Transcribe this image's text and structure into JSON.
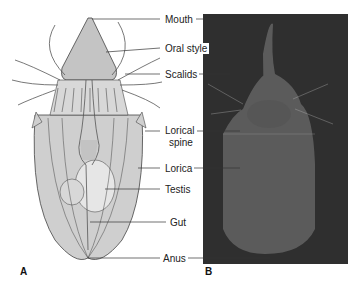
{
  "figure": {
    "panels": [
      "A",
      "B"
    ],
    "labels": [
      {
        "text": "Mouth",
        "x": 163,
        "y": 14
      },
      {
        "text": "Oral style",
        "x": 163,
        "y": 43
      },
      {
        "text": "Scalids",
        "x": 163,
        "y": 69
      },
      {
        "text": "Lorical",
        "x": 163,
        "y": 125
      },
      {
        "text": "spine",
        "x": 168,
        "y": 137
      },
      {
        "text": "Lorica",
        "x": 163,
        "y": 163
      },
      {
        "text": "Testis",
        "x": 163,
        "y": 184
      },
      {
        "text": "Gut",
        "x": 170,
        "y": 217
      },
      {
        "text": "Anus",
        "x": 163,
        "y": 253
      }
    ],
    "colors": {
      "illustration_fill": "#c9c9c9",
      "photo_bg": "#2f2f2f",
      "lines": "#333333"
    }
  }
}
